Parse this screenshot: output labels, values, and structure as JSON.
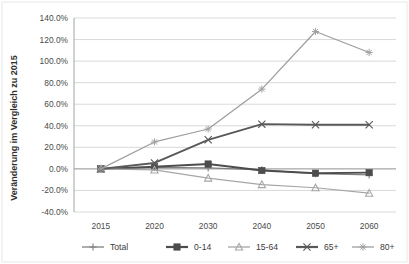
{
  "chart_data": {
    "type": "line",
    "title": "",
    "xlabel": "",
    "ylabel": "Veränderung im Vergleich zu 2015",
    "categories": [
      "2015",
      "2020",
      "2030",
      "2040",
      "2050",
      "2060"
    ],
    "ylim": [
      -40,
      140
    ],
    "ytick_values": [
      140,
      120,
      100,
      80,
      60,
      40,
      20,
      0,
      -20,
      -40
    ],
    "ytick_labels": [
      "140.0%",
      "120.0%",
      "100.0%",
      "80.0%",
      "60.0%",
      "40.0%",
      "20.0%",
      "0.0%",
      "-20.0%",
      "-40.0%"
    ],
    "grid": true,
    "legend_position": "bottom",
    "series": [
      {
        "name": "Total",
        "color": "#808080",
        "marker": "plus",
        "values": [
          0.0,
          1.5,
          1.0,
          -1.0,
          -4.5,
          -5.5
        ]
      },
      {
        "name": "0-14",
        "color": "#4d4d4d",
        "marker": "square",
        "values": [
          0.0,
          2.0,
          4.5,
          -1.5,
          -4.0,
          -3.5
        ]
      },
      {
        "name": "15-64",
        "color": "#a6a6a6",
        "marker": "triangle",
        "values": [
          0.0,
          -1.0,
          -8.5,
          -14.5,
          -17.5,
          -22.5
        ]
      },
      {
        "name": "65+",
        "color": "#595959",
        "marker": "x",
        "values": [
          0.0,
          5.5,
          27.0,
          41.5,
          41.0,
          41.0
        ]
      },
      {
        "name": "80+",
        "color": "#9e9e9e",
        "marker": "star",
        "values": [
          0.0,
          25.0,
          37.0,
          74.0,
          127.5,
          108.0
        ]
      }
    ]
  },
  "legend": {
    "items": [
      {
        "label": "Total"
      },
      {
        "label": "0-14"
      },
      {
        "label": "15-64"
      },
      {
        "label": "65+"
      },
      {
        "label": "80+"
      }
    ]
  }
}
